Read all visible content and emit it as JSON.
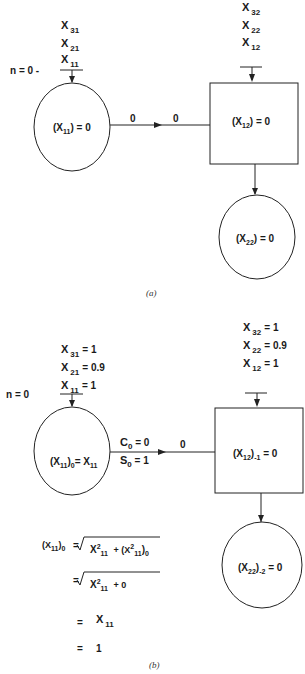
{
  "part_a": {
    "caption": "(a)",
    "n_label": "n = 0 -",
    "inputs_node1": [
      {
        "base": "X",
        "sub": "31"
      },
      {
        "base": "X",
        "sub": "21"
      },
      {
        "base": "X",
        "sub": "11"
      }
    ],
    "inputs_node2": [
      {
        "base": "X",
        "sub": "32"
      },
      {
        "base": "X",
        "sub": "22"
      },
      {
        "base": "X",
        "sub": "12"
      }
    ],
    "node1": {
      "shape": "circle",
      "label": "(X",
      "sub": "11",
      "tail": ") = 0"
    },
    "node2": {
      "shape": "square",
      "label": "(X",
      "sub": "12",
      "tail": ") = 0"
    },
    "node3": {
      "shape": "circle",
      "label": "(X",
      "sub": "22",
      "tail": ") = 0"
    },
    "edge_labels": [
      "0",
      "0"
    ]
  },
  "part_b": {
    "caption": "(b)",
    "n_label": "n = 0",
    "inputs_node1": [
      {
        "base": "X",
        "sub": "31",
        "value": "= 1"
      },
      {
        "base": "X",
        "sub": "21",
        "value": "= 0.9"
      },
      {
        "base": "X",
        "sub": "11",
        "value": "= 1"
      }
    ],
    "inputs_node2": [
      {
        "base": "X",
        "sub": "32",
        "value": "= 1"
      },
      {
        "base": "X",
        "sub": "22",
        "value": "= 0.9"
      },
      {
        "base": "X",
        "sub": "12",
        "value": "= 1"
      }
    ],
    "node1": {
      "shape": "circle",
      "label": "(X",
      "sub": "11",
      "mid": ")",
      "sub2": "0",
      "tail": "= X",
      "sub3": "11"
    },
    "node2": {
      "shape": "square",
      "label": "(X",
      "sub": "12",
      "mid": ")",
      "sub2": "-1",
      "tail": " = 0"
    },
    "node3": {
      "shape": "circle",
      "label": "(X",
      "sub": "22",
      "mid": ")",
      "sub2": "-2",
      "tail": " = 0"
    },
    "edge_top": {
      "base": "C",
      "sub": "0",
      "value": " = 0"
    },
    "edge_bottom": {
      "base": "S",
      "sub": "0",
      "value": " = 1"
    },
    "edge_right": "0",
    "derivation": {
      "line1_lhs": "(X",
      "line1_lhs_sub": "11",
      "line1_lhs_tail": ")",
      "line1_lhs_sub2": "0",
      "line1_eq": "=",
      "line1_term1": "X",
      "line1_term1_sup": "2",
      "line1_term1_sub": "11",
      "line1_plus": "+ (X",
      "line1_term2_sup": "2",
      "line1_term2_sub": "11",
      "line1_term2_tail": ")",
      "line1_term2_sub2": "0",
      "line2_eq": "=",
      "line2_term": "X",
      "line2_sup": "2",
      "line2_sub": "11",
      "line2_tail": "+ 0",
      "line3_eq": "=",
      "line3_term": "X",
      "line3_sub": "11",
      "line4_eq": "=",
      "line4_value": "1"
    }
  }
}
